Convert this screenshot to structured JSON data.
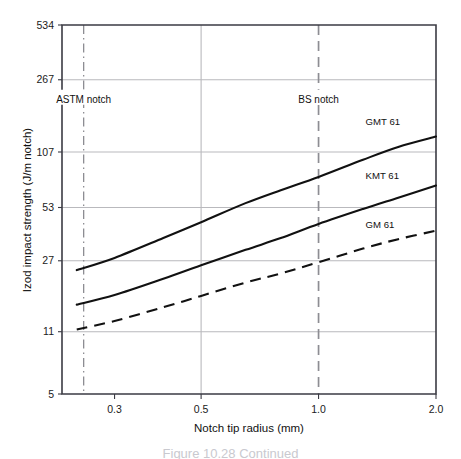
{
  "figure": {
    "caption": "Figure 10.28 Continued"
  },
  "chart_data": {
    "type": "line",
    "title": "",
    "xlabel": "Notch tip radius (mm)",
    "ylabel": "Izod impact strength (J/m notch)",
    "xscale": "log",
    "yscale": "log",
    "xlim": [
      0.22,
      2.0
    ],
    "ylim": [
      5,
      534
    ],
    "xticks": [
      0.3,
      0.5,
      1.0,
      2.0
    ],
    "xtick_labels": [
      "0.3",
      "0.5",
      "1.0",
      "2.0"
    ],
    "yticks": [
      5,
      11,
      27,
      53,
      107,
      267,
      534
    ],
    "ytick_labels": [
      "5",
      "11",
      "27",
      "53",
      "107",
      "267",
      "534"
    ],
    "grid": "horizontal gridlines at 11, 27, 53, 107, 267; vertical gridline at 0.5",
    "legend": "inline series labels at right of each curve",
    "series": [
      {
        "name": "GMT 61",
        "style": "solid",
        "label_x": 1.32,
        "label_y": 150,
        "x": [
          0.24,
          0.3,
          0.4,
          0.5,
          0.65,
          0.8,
          1.0,
          1.3,
          1.6,
          2.0
        ],
        "y": [
          24,
          28,
          36,
          44,
          56,
          66,
          78,
          97,
          114,
          130
        ]
      },
      {
        "name": "KMT 61",
        "style": "solid",
        "label_x": 1.32,
        "label_y": 76,
        "x": [
          0.24,
          0.3,
          0.4,
          0.5,
          0.65,
          0.8,
          1.0,
          1.3,
          1.6,
          2.0
        ],
        "y": [
          15.5,
          17.5,
          21.5,
          25.5,
          31,
          36,
          43,
          52,
          60,
          70
        ]
      },
      {
        "name": "GM 61",
        "style": "dashed",
        "label_x": 1.32,
        "label_y": 41,
        "x": [
          0.24,
          0.3,
          0.4,
          0.5,
          0.65,
          0.8,
          1.0,
          1.3,
          1.6,
          2.0
        ],
        "y": [
          11.3,
          12.6,
          15.0,
          17.3,
          20.5,
          23.0,
          26.5,
          31.5,
          35.5,
          39.5
        ]
      }
    ],
    "annotations": [
      {
        "text": "ASTM notch",
        "x": 0.25,
        "label_y": 210,
        "style": "dash-dot vertical reference line"
      },
      {
        "text": "BS notch",
        "x": 1.0,
        "label_y": 210,
        "style": "dashed vertical reference line"
      }
    ]
  }
}
